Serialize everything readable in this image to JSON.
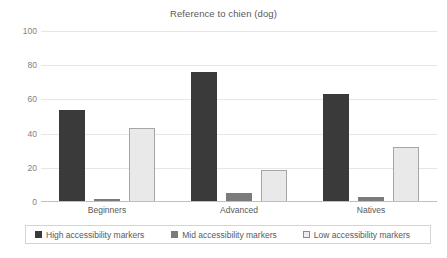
{
  "chart_data": {
    "type": "bar",
    "title": "Reference to chien (dog)",
    "xlabel": "",
    "ylabel": "",
    "ylim": [
      0,
      100
    ],
    "yticks": [
      100,
      80,
      60,
      40,
      20,
      0
    ],
    "grid": true,
    "legend_position": "bottom",
    "categories": [
      "Beginners",
      "Advanced",
      "Natives"
    ],
    "series": [
      {
        "name": "High accessibility markers",
        "color": "#3a3a3a",
        "values": [
          54,
          76,
          63
        ]
      },
      {
        "name": "Mid accessibility markers",
        "color": "#7b7b7b",
        "values": [
          2,
          5,
          3
        ]
      },
      {
        "name": "Low accessibility markers",
        "color": "#e9e9e9",
        "values": [
          43,
          19,
          32
        ]
      }
    ]
  },
  "axis": {
    "tick_100": "100",
    "tick_80": "80",
    "tick_60": "60",
    "tick_40": "40",
    "tick_20": "20",
    "tick_0": "0"
  },
  "colors": {
    "gridline": "#e6e6e6",
    "axis": "#bfbfbf",
    "text": "#595959",
    "tick_text": "#7f7f7f",
    "legend_border": "#d4d4d4",
    "low_border": "#a6a6a6"
  }
}
